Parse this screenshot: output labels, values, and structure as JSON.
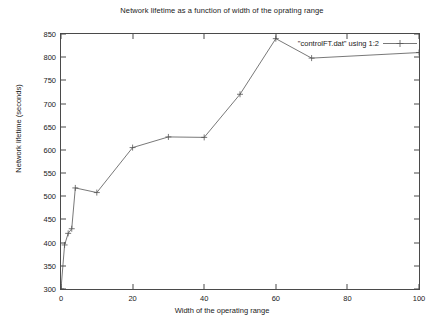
{
  "chart_data": {
    "type": "line",
    "title": "Network lifetime as a function of width of the oprating range",
    "xlabel": "Width of the operating range",
    "ylabel": "Network lifetime (seconds)",
    "xlim": [
      0,
      100
    ],
    "ylim": [
      300,
      850
    ],
    "xticks": [
      0,
      20,
      40,
      60,
      80,
      100
    ],
    "yticks": [
      300,
      350,
      400,
      450,
      500,
      550,
      600,
      650,
      700,
      750,
      800,
      850
    ],
    "grid": false,
    "legend_position": "top-right",
    "series": [
      {
        "name": "\"controlFT.dat\" using 1:2",
        "marker": "plus",
        "color": "#555555",
        "x": [
          0,
          1,
          2,
          3,
          4,
          10,
          20,
          30,
          40,
          50,
          60,
          70,
          100
        ],
        "y": [
          300,
          395,
          420,
          430,
          518,
          508,
          605,
          628,
          627,
          720,
          840,
          798,
          810
        ]
      }
    ]
  },
  "legend": {
    "entry_label": "\"controlFT.dat\" using 1:2"
  },
  "axis": {
    "x_tick_labels": [
      "0",
      "20",
      "40",
      "60",
      "80",
      "100"
    ],
    "y_tick_labels": [
      "300",
      "350",
      "400",
      "450",
      "500",
      "550",
      "600",
      "650",
      "700",
      "750",
      "800",
      "850"
    ]
  },
  "caption": {
    "text": ""
  }
}
